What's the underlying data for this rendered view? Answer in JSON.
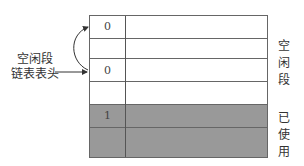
{
  "diagram": {
    "left_label": "空闲段\n链表表头",
    "left_label_lines": [
      "空闲段",
      "链表表头"
    ],
    "rows": [
      {
        "flag": "0",
        "state": "free"
      },
      {
        "flag": "",
        "state": "free"
      },
      {
        "flag": "0",
        "state": "free"
      },
      {
        "flag": "",
        "state": "free"
      },
      {
        "flag": "1",
        "state": "used"
      },
      {
        "flag": "",
        "state": "used"
      }
    ],
    "right_labels": {
      "free": [
        "空",
        "闲",
        "段"
      ],
      "used": [
        "已",
        "使",
        "用"
      ]
    },
    "colors": {
      "used_fill": "#999999",
      "free_fill": "#ffffff",
      "line": "#666666"
    }
  }
}
